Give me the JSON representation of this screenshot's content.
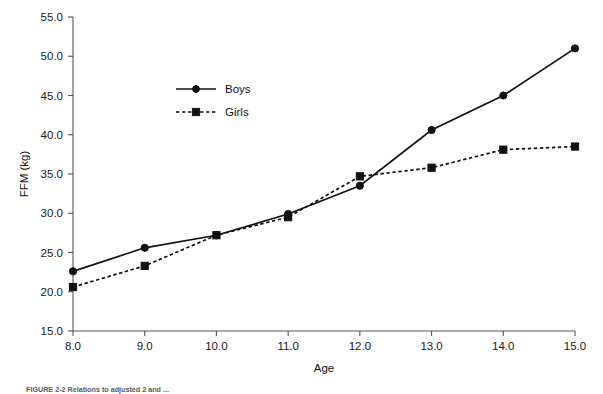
{
  "figure": {
    "caption": "FIGURE 2-2  Relations to adjusted 2 and ..."
  },
  "chart_data": {
    "type": "line",
    "title": "",
    "subtitle": "",
    "xlabel": "Age",
    "ylabel": "FFM (kg)",
    "x": [
      8.0,
      9.0,
      10.0,
      11.0,
      12.0,
      13.0,
      14.0,
      15.0
    ],
    "xtick_labels": [
      "8.0",
      "9.0",
      "10.0",
      "11.0",
      "12.0",
      "13.0",
      "14.0",
      "15.0"
    ],
    "ytick_labels": [
      "15.0",
      "20.0",
      "25.0",
      "30.0",
      "35.0",
      "40.0",
      "45.0",
      "50.0",
      "55.0"
    ],
    "yticks": [
      15.0,
      20.0,
      25.0,
      30.0,
      35.0,
      40.0,
      45.0,
      50.0,
      55.0
    ],
    "xlim": [
      8.0,
      15.0
    ],
    "ylim": [
      15.0,
      55.0
    ],
    "grid": false,
    "legend_position": "upper-center-left",
    "series": [
      {
        "name": "Boys",
        "marker": "circle",
        "linestyle": "solid",
        "color": "#111111",
        "values": [
          22.6,
          25.6,
          27.2,
          29.9,
          33.5,
          40.6,
          45.0,
          51.0
        ]
      },
      {
        "name": "Girls",
        "marker": "square",
        "linestyle": "dashed",
        "color": "#111111",
        "values": [
          20.6,
          23.3,
          27.2,
          29.5,
          34.7,
          35.8,
          38.1,
          38.5
        ]
      }
    ]
  }
}
